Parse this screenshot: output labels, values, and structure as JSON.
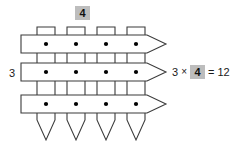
{
  "figure": {
    "type": "multiplication-array-arrow-model",
    "background_color": "#ffffff",
    "stroke_color": "#3b3b3b",
    "highlight_color": "#bdbdbd",
    "dot_color": "#000000"
  },
  "labels": {
    "row_count": "3",
    "column_count": "4"
  },
  "equation": {
    "factor_a": "3",
    "operator": "×",
    "factor_b": "4",
    "equals": "=",
    "product": "12",
    "full_text": "3 × 4 = 12"
  },
  "diagram": {
    "horizontal_arrows": {
      "count": 3,
      "direction": "right",
      "row_centers_y": [
        44,
        72,
        104
      ],
      "band_height": 18,
      "x_start": 21,
      "x_body_end": 147,
      "x_tip": 166
    },
    "vertical_arrows": {
      "count": 4,
      "direction": "down",
      "column_centers_x": [
        46,
        76,
        106,
        136
      ],
      "band_width": 18,
      "y_start": 27,
      "y_body_end": 120,
      "y_tip": 140
    },
    "dots": {
      "count": 12,
      "radius": 2.1,
      "positions": [
        {
          "x": 46,
          "y": 44
        },
        {
          "x": 76,
          "y": 44
        },
        {
          "x": 106,
          "y": 44
        },
        {
          "x": 136,
          "y": 44
        },
        {
          "x": 46,
          "y": 72
        },
        {
          "x": 76,
          "y": 72
        },
        {
          "x": 106,
          "y": 72
        },
        {
          "x": 136,
          "y": 72
        },
        {
          "x": 46,
          "y": 104
        },
        {
          "x": 76,
          "y": 104
        },
        {
          "x": 106,
          "y": 104
        },
        {
          "x": 136,
          "y": 104
        }
      ]
    }
  }
}
